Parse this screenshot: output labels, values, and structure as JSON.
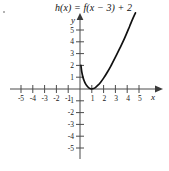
{
  "title": "h(x) = f(x − 3) + 2",
  "axis_names": {
    "x": "x",
    "y": "y"
  },
  "chart_data": {
    "type": "line",
    "title": "h(x) = f(x − 3) + 2",
    "subtitle": "",
    "xlabel": "x",
    "ylabel": "y",
    "xlim": [
      -5.8,
      6.3
    ],
    "ylim": [
      -6.3,
      6.5
    ],
    "grid": false,
    "legend": null,
    "x_ticks": [
      -5,
      -4,
      -3,
      -2,
      -1,
      1,
      2,
      3,
      4,
      5
    ],
    "x_tick_labels": [
      "-5",
      "-4",
      "-3",
      "-2",
      "-1",
      "1",
      "2",
      "3",
      "4",
      "5"
    ],
    "y_ticks": [
      5,
      4,
      3,
      2,
      1,
      -1,
      -2,
      -3,
      -4,
      -5
    ],
    "y_tick_labels": [
      "5",
      "4",
      "3",
      "2",
      "1",
      "-1",
      "-2",
      "-3",
      "-4",
      "-5"
    ],
    "axes_style": "arrowed-cartesian",
    "annotations": [],
    "series": [
      {
        "name": "h(x) = f(x - 3) + 2",
        "style": "solid-black-curve",
        "x": [
          0.08,
          0.15,
          0.25,
          0.35,
          0.45,
          0.6,
          0.75,
          0.9,
          1.0,
          1.15,
          1.3,
          1.5,
          1.75,
          2.0,
          2.3,
          2.6,
          3.0,
          3.4,
          3.8,
          4.2,
          4.45,
          4.7
        ],
        "y": [
          2.0,
          1.45,
          1.0,
          0.7,
          0.48,
          0.25,
          0.1,
          0.02,
          0.0,
          0.04,
          0.12,
          0.3,
          0.58,
          0.92,
          1.4,
          1.92,
          2.7,
          3.5,
          4.35,
          5.3,
          5.9,
          6.45
        ]
      }
    ]
  }
}
